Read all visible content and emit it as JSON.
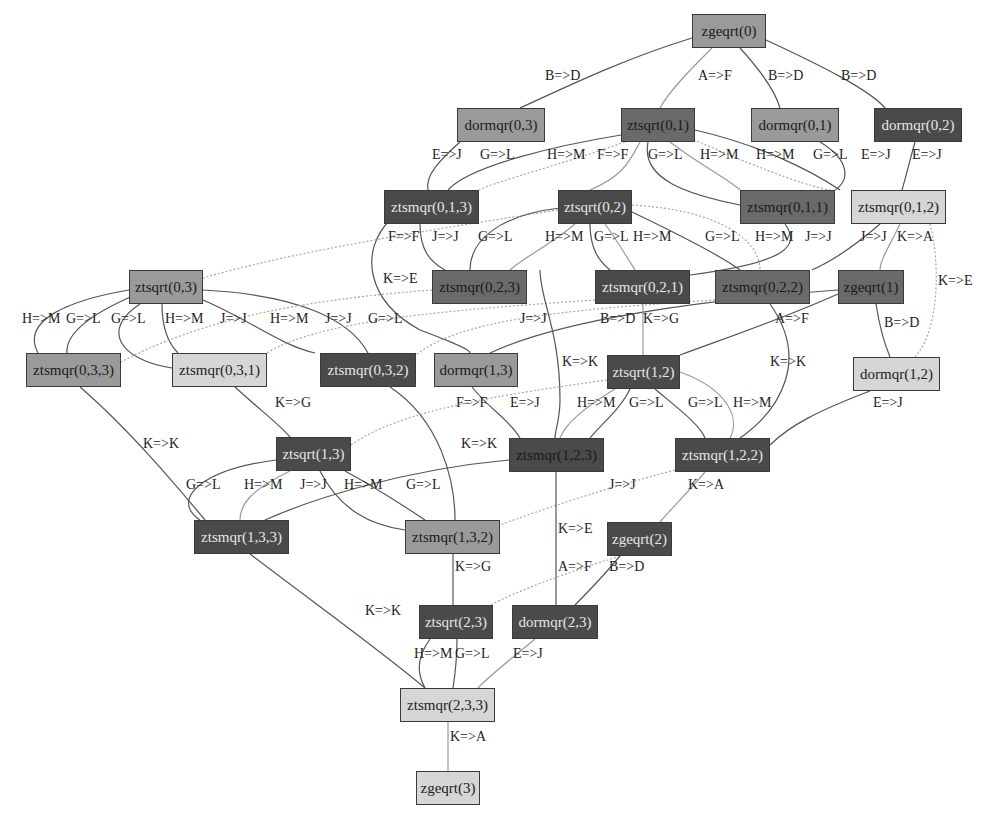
{
  "diagram": {
    "type": "task-dependency-dag",
    "nodes": [
      {
        "id": "zgeqrt0",
        "label": "zgeqrt(0)",
        "shade": "mid",
        "x": 692,
        "y": 14,
        "w": 74
      },
      {
        "id": "dormqr03",
        "label": "dormqr(0,3)",
        "shade": "mid",
        "x": 457,
        "y": 108,
        "w": 88
      },
      {
        "id": "ztsqrt01",
        "label": "ztsqrt(0,1)",
        "shade": "dark",
        "x": 621,
        "y": 108,
        "w": 74
      },
      {
        "id": "dormqr01",
        "label": "dormqr(0,1)",
        "shade": "mid",
        "x": 751,
        "y": 108,
        "w": 88
      },
      {
        "id": "dormqr02",
        "label": "dormqr(0,2)",
        "shade": "vdark",
        "x": 874,
        "y": 108,
        "w": 88
      },
      {
        "id": "ztsmqr013",
        "label": "ztsmqr(0,1,3)",
        "shade": "vdark",
        "x": 384,
        "y": 190,
        "w": 95
      },
      {
        "id": "ztsqrt02",
        "label": "ztsqrt(0,2)",
        "shade": "vdark",
        "x": 558,
        "y": 190,
        "w": 74
      },
      {
        "id": "ztsmqr011",
        "label": "ztsmqr(0,1,1)",
        "shade": "dark",
        "x": 740,
        "y": 190,
        "w": 95
      },
      {
        "id": "ztsmqr012",
        "label": "ztsmqr(0,1,2)",
        "shade": "light",
        "x": 851,
        "y": 190,
        "w": 95
      },
      {
        "id": "ztsqrt03",
        "label": "ztsqrt(0,3)",
        "shade": "mid",
        "x": 129,
        "y": 270,
        "w": 74
      },
      {
        "id": "ztsmqr023",
        "label": "ztsmqr(0,2,3)",
        "shade": "dark",
        "x": 432,
        "y": 270,
        "w": 95
      },
      {
        "id": "ztsmqr021",
        "label": "ztsmqr(0,2,1)",
        "shade": "vdark",
        "x": 595,
        "y": 270,
        "w": 95
      },
      {
        "id": "ztsmqr022",
        "label": "ztsmqr(0,2,2)",
        "shade": "dark",
        "x": 715,
        "y": 270,
        "w": 95
      },
      {
        "id": "zgeqrt1",
        "label": "zgeqrt(1)",
        "shade": "dark",
        "x": 838,
        "y": 270,
        "w": 66
      },
      {
        "id": "ztsmqr033",
        "label": "ztsmqr(0,3,3)",
        "shade": "mid",
        "x": 26,
        "y": 353,
        "w": 95
      },
      {
        "id": "ztsmqr031",
        "label": "ztsmqr(0,3,1)",
        "shade": "light",
        "x": 172,
        "y": 353,
        "w": 95
      },
      {
        "id": "ztsmqr032",
        "label": "ztsmqr(0,3,2)",
        "shade": "vdark",
        "x": 320,
        "y": 353,
        "w": 96
      },
      {
        "id": "dormqr13",
        "label": "dormqr(1,3)",
        "shade": "mid",
        "x": 434,
        "y": 353,
        "w": 84
      },
      {
        "id": "ztsqrt12",
        "label": "ztsqrt(1,2)",
        "shade": "vdark",
        "x": 607,
        "y": 355,
        "w": 73
      },
      {
        "id": "dormqr12",
        "label": "dormqr(1,2)",
        "shade": "light",
        "x": 853,
        "y": 357,
        "w": 87
      },
      {
        "id": "ztsqrt13",
        "label": "ztsqrt(1,3)",
        "shade": "vdark",
        "x": 276,
        "y": 437,
        "w": 75
      },
      {
        "id": "ztsmqr123",
        "label": "ztsmqr(1,2,3)",
        "shade": "vdark",
        "x": 509,
        "y": 438,
        "w": 95
      },
      {
        "id": "ztsmqr122",
        "label": "ztsmqr(1,2,2)",
        "shade": "vdark",
        "x": 675,
        "y": 438,
        "w": 95
      },
      {
        "id": "ztsmqr133",
        "label": "ztsmqr(1,3,3)",
        "shade": "vdark",
        "x": 194,
        "y": 520,
        "w": 95
      },
      {
        "id": "ztsmqr132",
        "label": "ztsmqr(1,3,2)",
        "shade": "mid",
        "x": 405,
        "y": 520,
        "w": 95
      },
      {
        "id": "zgeqrt2",
        "label": "zgeqrt(2)",
        "shade": "vdark",
        "x": 607,
        "y": 522,
        "w": 65
      },
      {
        "id": "ztsqrt23",
        "label": "ztsqrt(2,3)",
        "shade": "vdark",
        "x": 419,
        "y": 605,
        "w": 74
      },
      {
        "id": "dormqr23",
        "label": "dormqr(2,3)",
        "shade": "vdark",
        "x": 512,
        "y": 605,
        "w": 86
      },
      {
        "id": "ztsmqr233",
        "label": "ztsmqr(2,3,3)",
        "shade": "light",
        "x": 400,
        "y": 688,
        "w": 95
      },
      {
        "id": "zgeqrt3",
        "label": "zgeqrt(3)",
        "shade": "light",
        "x": 416,
        "y": 771,
        "w": 64
      }
    ],
    "edge_labels": [
      {
        "text": "B=>D",
        "x": 545,
        "y": 77
      },
      {
        "text": "A=>F",
        "x": 698,
        "y": 77
      },
      {
        "text": "B=>D",
        "x": 768,
        "y": 77
      },
      {
        "text": "B=>D",
        "x": 841,
        "y": 77
      },
      {
        "text": "E=>J",
        "x": 432,
        "y": 156
      },
      {
        "text": "G=>L",
        "x": 480,
        "y": 156
      },
      {
        "text": "H=>M",
        "x": 547,
        "y": 156
      },
      {
        "text": "F=>F",
        "x": 597,
        "y": 156
      },
      {
        "text": "G=>L",
        "x": 648,
        "y": 156
      },
      {
        "text": "H=>M",
        "x": 700,
        "y": 156
      },
      {
        "text": "H=>M",
        "x": 756,
        "y": 156
      },
      {
        "text": "G=>L",
        "x": 813,
        "y": 156
      },
      {
        "text": "E=>J",
        "x": 861,
        "y": 156
      },
      {
        "text": "E=>J",
        "x": 912,
        "y": 156
      },
      {
        "text": "F=>F",
        "x": 388,
        "y": 238
      },
      {
        "text": "J=>J",
        "x": 432,
        "y": 238
      },
      {
        "text": "G=>L",
        "x": 478,
        "y": 238
      },
      {
        "text": "H=>M",
        "x": 545,
        "y": 238
      },
      {
        "text": "G=>L",
        "x": 594,
        "y": 238
      },
      {
        "text": "H=>M",
        "x": 633,
        "y": 238
      },
      {
        "text": "G=>L",
        "x": 705,
        "y": 238
      },
      {
        "text": "H=>M",
        "x": 755,
        "y": 238
      },
      {
        "text": "J=>J",
        "x": 805,
        "y": 238
      },
      {
        "text": "J=>J",
        "x": 860,
        "y": 238
      },
      {
        "text": "K=>A",
        "x": 897,
        "y": 238
      },
      {
        "text": "K=>E",
        "x": 383,
        "y": 280
      },
      {
        "text": "K=>E",
        "x": 938,
        "y": 282
      },
      {
        "text": "H=>M",
        "x": 22,
        "y": 320
      },
      {
        "text": "G=>L",
        "x": 66,
        "y": 320
      },
      {
        "text": "G=>L",
        "x": 111,
        "y": 320
      },
      {
        "text": "H=>M",
        "x": 165,
        "y": 320
      },
      {
        "text": "J=>J",
        "x": 220,
        "y": 320
      },
      {
        "text": "H=>M",
        "x": 270,
        "y": 320
      },
      {
        "text": "J=>J",
        "x": 325,
        "y": 320
      },
      {
        "text": "G=>L",
        "x": 368,
        "y": 320
      },
      {
        "text": "J=>J",
        "x": 520,
        "y": 320
      },
      {
        "text": "B=>D",
        "x": 600,
        "y": 320
      },
      {
        "text": "K=>G",
        "x": 643,
        "y": 320
      },
      {
        "text": "A=>F",
        "x": 775,
        "y": 320
      },
      {
        "text": "B=>D",
        "x": 884,
        "y": 324
      },
      {
        "text": "K=>K",
        "x": 562,
        "y": 363
      },
      {
        "text": "K=>K",
        "x": 770,
        "y": 363
      },
      {
        "text": "K=>G",
        "x": 275,
        "y": 404
      },
      {
        "text": "F=>F",
        "x": 456,
        "y": 404
      },
      {
        "text": "E=>J",
        "x": 510,
        "y": 404
      },
      {
        "text": "H=>M",
        "x": 577,
        "y": 404
      },
      {
        "text": "G=>L",
        "x": 629,
        "y": 404
      },
      {
        "text": "G=>L",
        "x": 688,
        "y": 404
      },
      {
        "text": "H=>M",
        "x": 733,
        "y": 404
      },
      {
        "text": "E=>J",
        "x": 873,
        "y": 404
      },
      {
        "text": "K=>K",
        "x": 143,
        "y": 445
      },
      {
        "text": "K=>K",
        "x": 461,
        "y": 445
      },
      {
        "text": "G=>L",
        "x": 186,
        "y": 486
      },
      {
        "text": "H=>M",
        "x": 244,
        "y": 486
      },
      {
        "text": "J=>J",
        "x": 300,
        "y": 486
      },
      {
        "text": "H=>M",
        "x": 344,
        "y": 486
      },
      {
        "text": "G=>L",
        "x": 406,
        "y": 486
      },
      {
        "text": "J=>J",
        "x": 609,
        "y": 486
      },
      {
        "text": "K=>A",
        "x": 688,
        "y": 486
      },
      {
        "text": "K=>E",
        "x": 558,
        "y": 530
      },
      {
        "text": "K=>G",
        "x": 455,
        "y": 568
      },
      {
        "text": "A=>F",
        "x": 558,
        "y": 568
      },
      {
        "text": "B=>D",
        "x": 609,
        "y": 568
      },
      {
        "text": "K=>K",
        "x": 365,
        "y": 612
      },
      {
        "text": "H=>M",
        "x": 414,
        "y": 655
      },
      {
        "text": "G=>L",
        "x": 455,
        "y": 655
      },
      {
        "text": "E=>J",
        "x": 513,
        "y": 655
      },
      {
        "text": "K=>A",
        "x": 450,
        "y": 738
      }
    ]
  },
  "colors": {
    "background": "#ffffff",
    "node_light": "#d6d6d6",
    "node_mid": "#9a9a9a",
    "node_dark": "#6a6a6a",
    "node_vdark": "#4a4a4a",
    "edge_solid": "#555555",
    "edge_light": "#9a9a9a"
  }
}
